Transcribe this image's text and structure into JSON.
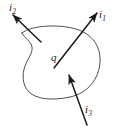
{
  "figure": {
    "kind": "closed-surface-current-diagram",
    "background_color": "#ffffff",
    "stroke_color": "#3a3a3a",
    "arrow_color": "#1a1a1a",
    "text_color": "#1a1a1a",
    "enclosed_charge": {
      "symbol": "q",
      "name": "enclosed-charge-label"
    },
    "surface": {
      "name": "closed-surface-outline",
      "shape": "bean",
      "filled": false,
      "stroke_width": 0.9
    },
    "currents": [
      {
        "id": "i1",
        "symbol": "i",
        "subscript": "1",
        "direction": "out",
        "heading": "up-right",
        "tail": [
          54,
          68
        ],
        "tip": [
          97,
          13
        ]
      },
      {
        "id": "i2",
        "symbol": "i",
        "subscript": "2",
        "direction": "out",
        "heading": "up-left",
        "tail": [
          41,
          42
        ],
        "tip": [
          13,
          15
        ]
      },
      {
        "id": "i3",
        "symbol": "i",
        "subscript": "3",
        "direction": "in",
        "heading": "up",
        "tail": [
          87,
          125
        ],
        "tip": [
          69,
          75
        ]
      }
    ]
  }
}
